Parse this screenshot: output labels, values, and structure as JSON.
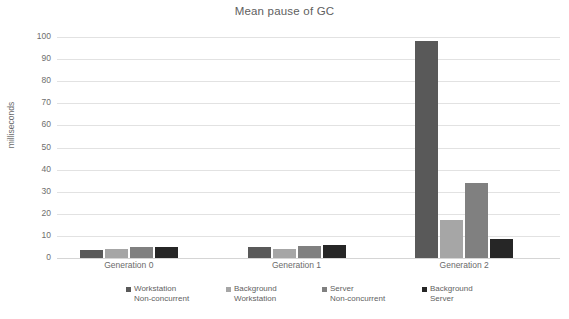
{
  "chart_data": {
    "type": "bar",
    "title": "Mean pause of GC",
    "xlabel": "",
    "ylabel": "milliseconds",
    "ylim": [
      0,
      100
    ],
    "yticks": [
      0,
      10,
      20,
      30,
      40,
      50,
      60,
      70,
      80,
      90,
      100
    ],
    "ytick_labels": [
      "0",
      "10",
      "20",
      "30",
      "40",
      "50",
      "60",
      "70",
      "80",
      "90",
      "100"
    ],
    "grid": true,
    "legend_position": "bottom",
    "categories": [
      "Generation 0",
      "Generation 1",
      "Generation 2"
    ],
    "series": [
      {
        "name": "Workstation Non-concurrent",
        "color": "#595959",
        "values": [
          3.5,
          5.0,
          98.0
        ]
      },
      {
        "name": "Background Workstation",
        "color": "#a6a6a6",
        "values": [
          4.0,
          4.0,
          17.0
        ]
      },
      {
        "name": "Server Non-concurrent",
        "color": "#808080",
        "values": [
          5.0,
          5.5,
          34.0
        ]
      },
      {
        "name": "Background Server",
        "color": "#262626",
        "values": [
          5.0,
          6.0,
          8.5
        ]
      }
    ]
  },
  "legend": {
    "items": [
      {
        "label": "Workstation\nNon-concurrent",
        "color": "#595959"
      },
      {
        "label": "Background\nWorkstation",
        "color": "#a6a6a6"
      },
      {
        "label": "Server\nNon-concurrent",
        "color": "#808080"
      },
      {
        "label": "Background\nServer",
        "color": "#262626"
      }
    ]
  }
}
